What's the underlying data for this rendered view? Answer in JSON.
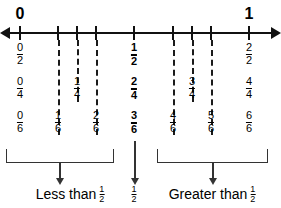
{
  "figure": {
    "line_color": "#111111",
    "dash_color": "#1a1a1a",
    "bracket_color": "#333333"
  },
  "endpoints": [
    {
      "label": "0",
      "x": 20
    },
    {
      "label": "1",
      "x": 249
    }
  ],
  "ticks": [
    20,
    58,
    77,
    96,
    134,
    173,
    192,
    211,
    249
  ],
  "dashes": [
    {
      "name": "dash-one-sixth",
      "x": 58,
      "top": 40,
      "height": 95
    },
    {
      "name": "dash-one-fourth",
      "x": 77,
      "top": 40,
      "height": 62
    },
    {
      "name": "dash-two-sixths",
      "x": 96,
      "top": 40,
      "height": 95
    },
    {
      "name": "dash-four-sixths",
      "x": 173,
      "top": 40,
      "height": 95
    },
    {
      "name": "dash-three-fourths",
      "x": 192,
      "top": 40,
      "height": 62
    },
    {
      "name": "dash-five-sixths",
      "x": 211,
      "top": 40,
      "height": 95
    }
  ],
  "rows": [
    {
      "name": "halves-row",
      "denominator": "2",
      "top": 42,
      "fractions": [
        {
          "numerator": "0",
          "denominator": "2",
          "x": 20,
          "bold": false
        },
        {
          "numerator": "1",
          "denominator": "2",
          "x": 134,
          "bold": true
        },
        {
          "numerator": "2",
          "denominator": "2",
          "x": 249,
          "bold": false
        }
      ]
    },
    {
      "name": "fourths-row",
      "denominator": "4",
      "top": 76,
      "fractions": [
        {
          "numerator": "0",
          "denominator": "4",
          "x": 20,
          "bold": false
        },
        {
          "numerator": "1",
          "denominator": "4",
          "x": 77,
          "bold": false
        },
        {
          "numerator": "2",
          "denominator": "4",
          "x": 134,
          "bold": true
        },
        {
          "numerator": "3",
          "denominator": "4",
          "x": 192,
          "bold": false
        },
        {
          "numerator": "4",
          "denominator": "4",
          "x": 249,
          "bold": false
        }
      ]
    },
    {
      "name": "sixths-row",
      "denominator": "6",
      "top": 110,
      "fractions": [
        {
          "numerator": "0",
          "denominator": "6",
          "x": 20,
          "bold": false
        },
        {
          "numerator": "1",
          "denominator": "6",
          "x": 58,
          "bold": false
        },
        {
          "numerator": "2",
          "denominator": "6",
          "x": 96,
          "bold": false
        },
        {
          "numerator": "3",
          "denominator": "6",
          "x": 134,
          "bold": true
        },
        {
          "numerator": "4",
          "denominator": "6",
          "x": 173,
          "bold": false
        },
        {
          "numerator": "5",
          "denominator": "6",
          "x": 211,
          "bold": false
        },
        {
          "numerator": "6",
          "denominator": "6",
          "x": 249,
          "bold": false
        }
      ]
    }
  ],
  "groups": [
    {
      "name": "less-than-half",
      "bracket": {
        "left": 6,
        "width": 106,
        "top": 149
      },
      "stem": {
        "x": 59,
        "top": 162,
        "height": 16
      },
      "caption": {
        "x": 70,
        "top": 184,
        "text": "Less than",
        "fraction_numerator": "1",
        "fraction_denominator": "2"
      }
    },
    {
      "name": "equal-to-half",
      "bracket": null,
      "stem": {
        "x": 134,
        "top": 141,
        "height": 37
      },
      "caption": {
        "x": 134,
        "top": 184,
        "text": "",
        "fraction_numerator": "1",
        "fraction_denominator": "2"
      }
    },
    {
      "name": "greater-than-half",
      "bracket": {
        "left": 157,
        "width": 109,
        "top": 149
      },
      "stem": {
        "x": 212,
        "top": 162,
        "height": 16
      },
      "caption": {
        "x": 212,
        "top": 184,
        "text": "Greater than",
        "fraction_numerator": "1",
        "fraction_denominator": "2"
      }
    }
  ]
}
